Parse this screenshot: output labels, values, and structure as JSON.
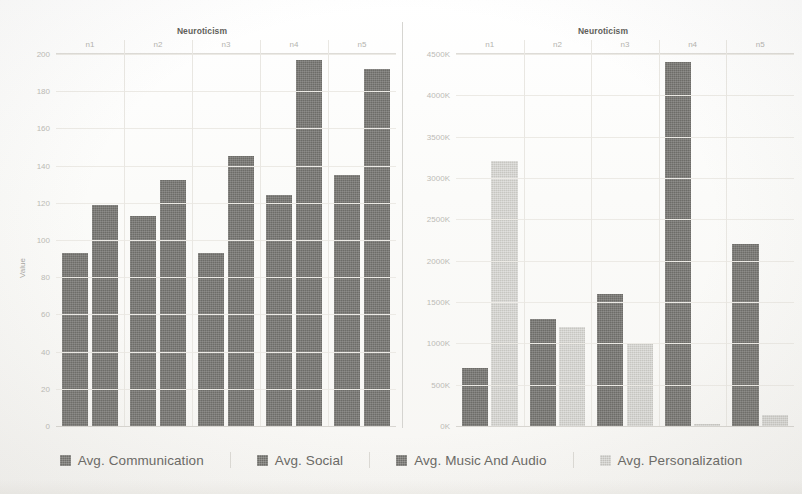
{
  "legend": {
    "items": [
      {
        "label": "Avg. Communication",
        "swatch": "dark"
      },
      {
        "label": "Avg. Social",
        "swatch": "dark"
      },
      {
        "label": "Avg. Music And Audio",
        "swatch": "dark"
      },
      {
        "label": "Avg. Personalization",
        "swatch": "light"
      }
    ]
  },
  "chart_data": [
    {
      "type": "bar",
      "title": "Neuroticism",
      "panel": "left",
      "xlabel": "",
      "ylabel": "Value",
      "categories": [
        "n1",
        "n2",
        "n3",
        "n4",
        "n5"
      ],
      "ylim": [
        0,
        200
      ],
      "yticks": [
        0,
        20,
        40,
        60,
        80,
        100,
        120,
        140,
        160,
        180,
        200
      ],
      "yticklabels": [
        "0",
        "20",
        "40",
        "60",
        "80",
        "100",
        "120",
        "140",
        "160",
        "180",
        "200"
      ],
      "grid": true,
      "legend_position": "bottom",
      "series": [
        {
          "name": "Avg. Communication",
          "color": "#6d6c68",
          "values": [
            93,
            113,
            93,
            124,
            135
          ]
        },
        {
          "name": "Avg. Social",
          "color": "#6d6c68",
          "values": [
            119,
            132,
            145,
            197,
            192
          ]
        }
      ]
    },
    {
      "type": "bar",
      "title": "Neuroticism",
      "panel": "right",
      "xlabel": "",
      "ylabel": "",
      "categories": [
        "n1",
        "n2",
        "n3",
        "n4",
        "n5"
      ],
      "ylim": [
        0,
        4500
      ],
      "yticks": [
        0,
        500,
        1000,
        1500,
        2000,
        2500,
        3000,
        3500,
        4000,
        4500
      ],
      "yticklabels": [
        "0K",
        "500K",
        "1000K",
        "1500K",
        "2000K",
        "2500K",
        "3000K",
        "3500K",
        "4000K",
        "4500K"
      ],
      "grid": true,
      "legend_position": "bottom",
      "series": [
        {
          "name": "Avg. Music And Audio",
          "color": "#6d6c68",
          "values": [
            700,
            1300,
            1600,
            4400,
            2200
          ]
        },
        {
          "name": "Avg. Personalization",
          "color": "#c7c6c1",
          "values": [
            3200,
            1200,
            1000,
            30,
            130
          ]
        }
      ]
    }
  ]
}
